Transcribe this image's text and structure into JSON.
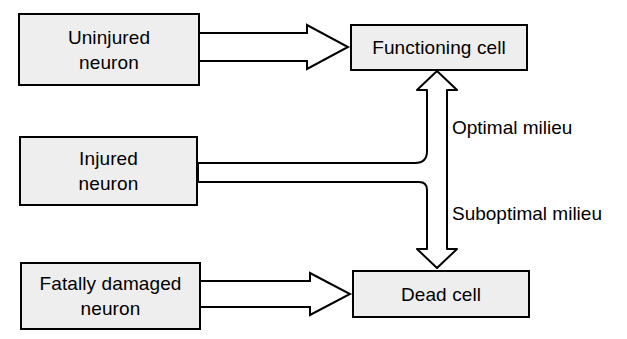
{
  "diagram": {
    "background_color": "#ffffff",
    "box_fill_color": "#eeeeee",
    "line_color": "#000000",
    "nodes": [
      {
        "id": "uninjured-neuron",
        "label": "Uninjured\nneuron",
        "x": 18,
        "y": 13,
        "w": 182,
        "h": 73
      },
      {
        "id": "functioning-cell",
        "label": "Functioning cell",
        "x": 350,
        "y": 24,
        "w": 178,
        "h": 47
      },
      {
        "id": "injured-neuron",
        "label": "Injured\nneuron",
        "x": 19,
        "y": 136,
        "w": 179,
        "h": 70
      },
      {
        "id": "fatally-damaged-neuron",
        "label": "Fatally damaged\nneuron",
        "x": 20,
        "y": 262,
        "w": 181,
        "h": 68
      },
      {
        "id": "dead-cell",
        "label": "Dead cell",
        "x": 352,
        "y": 270,
        "w": 178,
        "h": 48
      }
    ],
    "edge_labels": [
      {
        "id": "optimal-milieu",
        "text": "Optimal milieu",
        "x": 452,
        "y": 117
      },
      {
        "id": "suboptimal-milieu",
        "text": "Suboptimal milieu",
        "x": 452,
        "y": 203
      }
    ],
    "edges": [
      {
        "id": "uninjured-to-functioning",
        "from": "uninjured-neuron",
        "to": "functioning-cell",
        "style": "block-arrow-right"
      },
      {
        "id": "injured-to-fork",
        "from": "injured-neuron",
        "to": "fork-junction",
        "style": "block-line-right"
      },
      {
        "id": "fork-to-functioning",
        "from": "fork-junction",
        "to": "functioning-cell",
        "style": "block-arrow-up"
      },
      {
        "id": "fork-to-dead",
        "from": "fork-junction",
        "to": "dead-cell",
        "style": "block-arrow-down"
      },
      {
        "id": "fatally-damaged-to-dead",
        "from": "fatally-damaged-neuron",
        "to": "dead-cell",
        "style": "block-arrow-right"
      }
    ]
  }
}
